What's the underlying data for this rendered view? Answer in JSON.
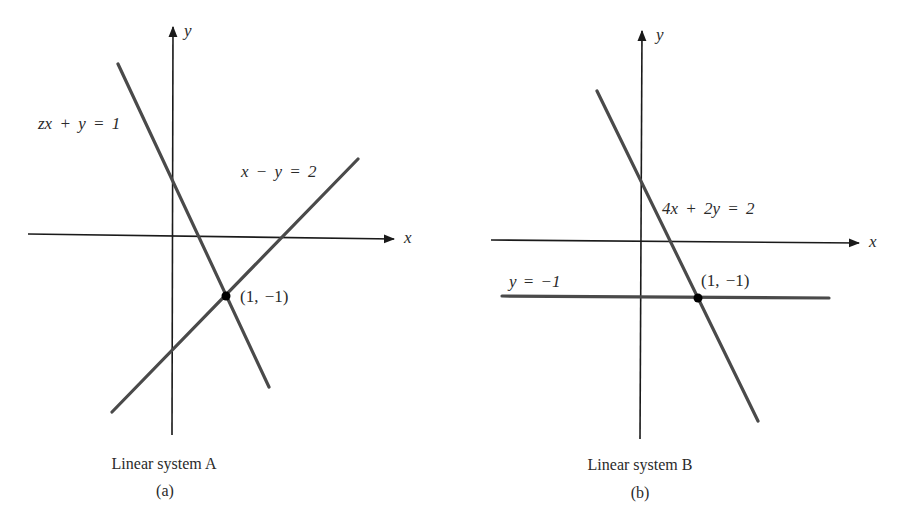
{
  "panels": [
    {
      "id": "a",
      "caption": "Linear system A",
      "sublabel": "(a)",
      "x_axis_label": "x",
      "y_axis_label": "y",
      "equations": [
        "zx + y = 1",
        "x − y = 2"
      ],
      "intersection_label": "(1, −1)"
    },
    {
      "id": "b",
      "caption": "Linear system B",
      "sublabel": "(b)",
      "x_axis_label": "x",
      "y_axis_label": "y",
      "equations": [
        "4x + 2y = 2",
        "y = −1"
      ],
      "intersection_label": "(1, −1)"
    }
  ],
  "colors": {
    "axis": "#1a1a1a",
    "line": "#4a4a4a",
    "point": "#000000",
    "background": "#ffffff"
  }
}
